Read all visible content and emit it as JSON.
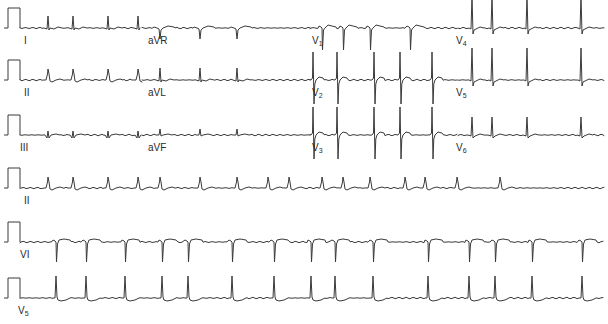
{
  "figure": {
    "trace_color": "#3a3a3a",
    "background": "#ffffff"
  },
  "calibration": {
    "x_start": 8,
    "x_end": 20,
    "height": 20
  },
  "rows": [
    {
      "baseline_y": 28,
      "segments": [
        {
          "lead": "I",
          "label": "I",
          "sub": "",
          "x_start": 20,
          "x_end": 142,
          "label_x": 24,
          "morph": "upright_small",
          "beats": [
            48,
            73,
            108,
            138
          ]
        },
        {
          "lead": "aVR",
          "label": "aVR",
          "sub": "",
          "x_start": 142,
          "x_end": 310,
          "label_x": 148,
          "morph": "inverted",
          "beats": [
            160,
            200,
            237
          ]
        },
        {
          "lead": "V1",
          "label": "V",
          "sub": "1",
          "x_start": 310,
          "x_end": 458,
          "label_x": 312,
          "morph": "rS",
          "beats": [
            322,
            343,
            370,
            410
          ]
        },
        {
          "lead": "V4",
          "label": "V",
          "sub": "4",
          "x_start": 458,
          "x_end": 604,
          "label_x": 456,
          "morph": "tall_R",
          "beats": [
            472,
            492,
            527,
            581
          ]
        }
      ]
    },
    {
      "baseline_y": 80,
      "segments": [
        {
          "lead": "II",
          "label": "II",
          "sub": "",
          "x_start": 20,
          "x_end": 142,
          "label_x": 24,
          "morph": "upright_round",
          "beats": [
            48,
            73,
            108,
            138
          ]
        },
        {
          "lead": "aVL",
          "label": "aVL",
          "sub": "",
          "x_start": 142,
          "x_end": 310,
          "label_x": 148,
          "morph": "upright_small",
          "beats": [
            160,
            200,
            237
          ]
        },
        {
          "lead": "V2",
          "label": "V",
          "sub": "2",
          "x_start": 310,
          "x_end": 458,
          "label_x": 312,
          "morph": "RS_deep",
          "beats": [
            313,
            337,
            374,
            400,
            432
          ]
        },
        {
          "lead": "V5",
          "label": "V",
          "sub": "5",
          "x_start": 458,
          "x_end": 604,
          "label_x": 456,
          "morph": "tall_R",
          "beats": [
            472,
            492,
            527,
            581
          ]
        }
      ]
    },
    {
      "baseline_y": 135,
      "segments": [
        {
          "lead": "III",
          "label": "III",
          "sub": "",
          "x_start": 20,
          "x_end": 142,
          "label_x": 20,
          "morph": "biphasic_small",
          "beats": [
            48,
            73,
            108,
            138
          ]
        },
        {
          "lead": "aVF",
          "label": "aVF",
          "sub": "",
          "x_start": 142,
          "x_end": 310,
          "label_x": 148,
          "morph": "upright_tiny",
          "beats": [
            160,
            200,
            237
          ]
        },
        {
          "lead": "V3",
          "label": "V",
          "sub": "3",
          "x_start": 310,
          "x_end": 458,
          "label_x": 312,
          "morph": "RS_deep",
          "beats": [
            313,
            337,
            374,
            400,
            432
          ]
        },
        {
          "lead": "V6",
          "label": "V",
          "sub": "6",
          "x_start": 458,
          "x_end": 604,
          "label_x": 456,
          "morph": "upright_med",
          "beats": [
            472,
            492,
            527,
            581
          ]
        }
      ]
    },
    {
      "baseline_y": 188,
      "segments": [
        {
          "lead": "II",
          "label": "II",
          "sub": "",
          "x_start": 20,
          "x_end": 604,
          "label_x": 24,
          "morph": "upright_round",
          "beats": [
            48,
            73,
            108,
            138,
            160,
            200,
            237,
            268,
            289,
            322,
            343,
            370,
            405,
            425,
            457,
            500
          ]
        }
      ]
    },
    {
      "baseline_y": 242,
      "segments": [
        {
          "lead": "V1",
          "label": "VI",
          "sub": "",
          "x_start": 20,
          "x_end": 604,
          "label_x": 20,
          "morph": "QS_deep",
          "beats": [
            56,
            86,
            125,
            162,
            188,
            232,
            274,
            311,
            335,
            373,
            428,
            469,
            495,
            532,
            582
          ]
        }
      ]
    },
    {
      "baseline_y": 298,
      "segments": [
        {
          "lead": "V5",
          "label": "V",
          "sub": "5",
          "x_start": 20,
          "x_end": 604,
          "label_x": 18,
          "morph": "R_dip",
          "beats": [
            56,
            86,
            125,
            162,
            188,
            232,
            274,
            311,
            335,
            373,
            428,
            469,
            495,
            532,
            582
          ]
        }
      ]
    }
  ]
}
